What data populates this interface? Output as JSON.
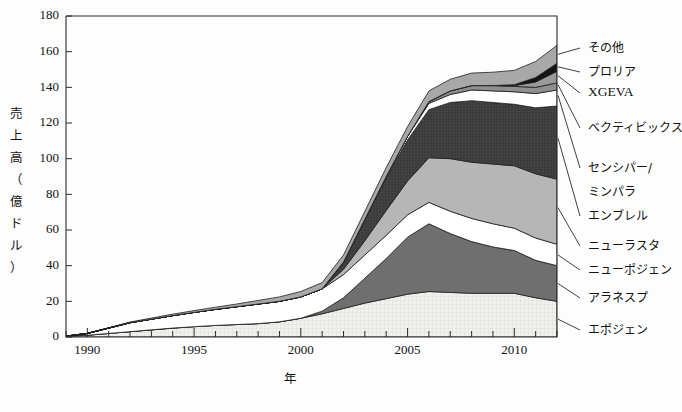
{
  "chart_data": {
    "type": "area",
    "stacked": true,
    "title": "",
    "xlabel": "年",
    "ylabel": "売上高（億ドル）",
    "ylabel_chars": [
      "売",
      "上",
      "高",
      "（",
      "億",
      "ド",
      "ル",
      "）"
    ],
    "xlim": [
      1989,
      2012
    ],
    "ylim": [
      0,
      180
    ],
    "ytick_values": [
      0,
      20,
      40,
      60,
      80,
      100,
      120,
      140,
      160,
      180
    ],
    "ytick_labels": [
      "0",
      "20",
      "40",
      "60",
      "80",
      "100",
      "120",
      "140",
      "160",
      "180"
    ],
    "xtick_labels": [
      "1990",
      "1995",
      "2000",
      "2005",
      "2010"
    ],
    "xtick_values": [
      1990,
      1995,
      2000,
      2005,
      2010
    ],
    "xminor_step": 1,
    "grid": false,
    "legend_position": "right-callout",
    "x": [
      1989,
      1990,
      1991,
      1992,
      1993,
      1994,
      1995,
      1996,
      1997,
      1998,
      1999,
      2000,
      2001,
      2002,
      2003,
      2004,
      2005,
      2006,
      2007,
      2008,
      2009,
      2010,
      2011,
      2012
    ],
    "series": [
      {
        "name": "エポジェン",
        "color": "#eeeeea",
        "texture": "fine-grid",
        "values": [
          0.5,
          1.0,
          2.0,
          3.0,
          4.0,
          5.0,
          5.8,
          6.5,
          7.0,
          7.5,
          8.5,
          10.5,
          13.0,
          16.0,
          19.0,
          21.5,
          24.0,
          25.5,
          25.0,
          24.5,
          24.5,
          24.5,
          22.0,
          20.0
        ]
      },
      {
        "name": "アラネスプ",
        "color": "#6f6f6f",
        "texture": "solid",
        "values": [
          0,
          0,
          0,
          0,
          0,
          0,
          0,
          0,
          0,
          0,
          0,
          0,
          1.5,
          6.0,
          14.0,
          22.5,
          32.0,
          38.0,
          33.0,
          29.0,
          26.0,
          24.0,
          21.0,
          20.0
        ]
      },
      {
        "name": "ニューポジェン",
        "color": "#ffffff",
        "texture": "solid",
        "values": [
          0,
          1.0,
          3.0,
          5.0,
          6.0,
          7.0,
          8.0,
          9.0,
          10.0,
          11.0,
          11.5,
          12.0,
          12.5,
          13.0,
          13.0,
          13.0,
          12.5,
          12.0,
          12.5,
          13.0,
          13.0,
          12.5,
          12.5,
          12.0
        ]
      },
      {
        "name": "ニューラスタ",
        "color": "#b6b6b6",
        "texture": "solid",
        "values": [
          0,
          0,
          0,
          0,
          0,
          0,
          0,
          0,
          0,
          0,
          0,
          0,
          0,
          3.0,
          8.0,
          14.0,
          19.0,
          25.0,
          29.5,
          31.5,
          33.5,
          35.0,
          36.0,
          36.5
        ]
      },
      {
        "name": "エンブレル",
        "color": "#3b3b3b",
        "texture": "crosshatch",
        "values": [
          0,
          0,
          0,
          0,
          0,
          0,
          0,
          0,
          0,
          0,
          0,
          0,
          0,
          4.0,
          12.0,
          18.5,
          23.0,
          27.0,
          31.5,
          34.5,
          34.5,
          34.5,
          37.0,
          41.0
        ]
      },
      {
        "name": "センシパー/ミンパラ",
        "color": "#ffffff",
        "texture": "solid",
        "values": [
          0,
          0,
          0,
          0,
          0,
          0,
          0,
          0,
          0,
          0,
          0,
          0,
          0,
          0,
          0,
          0.5,
          2.0,
          3.5,
          4.5,
          6.0,
          6.5,
          7.0,
          8.0,
          9.0
        ]
      },
      {
        "name": "ベクティビックス",
        "color": "#8f8f8f",
        "texture": "solid",
        "values": [
          0,
          0,
          0,
          0,
          0,
          0,
          0,
          0,
          0,
          0,
          0,
          0,
          0,
          0,
          0,
          0,
          0,
          1.0,
          2.0,
          2.5,
          3.0,
          3.0,
          3.5,
          4.0
        ]
      },
      {
        "name": "XGEVA",
        "color": "#9a9a9a",
        "texture": "solid",
        "values": [
          0,
          0,
          0,
          0,
          0,
          0,
          0,
          0,
          0,
          0,
          0,
          0,
          0,
          0,
          0,
          0,
          0,
          0,
          0,
          0,
          0,
          0.5,
          3.0,
          6.5
        ]
      },
      {
        "name": "プロリア",
        "color": "#141414",
        "texture": "solid",
        "values": [
          0,
          0,
          0,
          0,
          0,
          0,
          0,
          0,
          0,
          0,
          0,
          0,
          0,
          0,
          0,
          0,
          0,
          0,
          0,
          0,
          0,
          0.5,
          2.5,
          4.5
        ]
      },
      {
        "name": "その他",
        "color": "#a8a8a8",
        "texture": "solid",
        "values": [
          0,
          0,
          0.2,
          0.4,
          0.6,
          0.8,
          1.0,
          1.2,
          1.5,
          2.0,
          2.5,
          3.0,
          3.5,
          4.0,
          4.5,
          5.0,
          5.5,
          6.0,
          6.5,
          7.0,
          7.5,
          8.0,
          9.0,
          10.0
        ]
      }
    ],
    "callouts": [
      {
        "label": "その他",
        "series": "その他"
      },
      {
        "label": "プロリア",
        "series": "プロリア"
      },
      {
        "label": "XGEVA",
        "series": "XGEVA"
      },
      {
        "label": "ベクティビックス",
        "series": "ベクティビックス"
      },
      {
        "label": "センシパー/",
        "series": "センシパー/ミンパラ"
      },
      {
        "label": "ミンパラ",
        "series": "センシパー/ミンパラ"
      },
      {
        "label": "エンブレル",
        "series": "エンブレル"
      },
      {
        "label": "ニューラスタ",
        "series": "ニューラスタ"
      },
      {
        "label": "ニューポジェン",
        "series": "ニューポジェン"
      },
      {
        "label": "アラネスプ",
        "series": "アラネスプ"
      },
      {
        "label": "エポジェン",
        "series": "エポジェン"
      }
    ]
  }
}
